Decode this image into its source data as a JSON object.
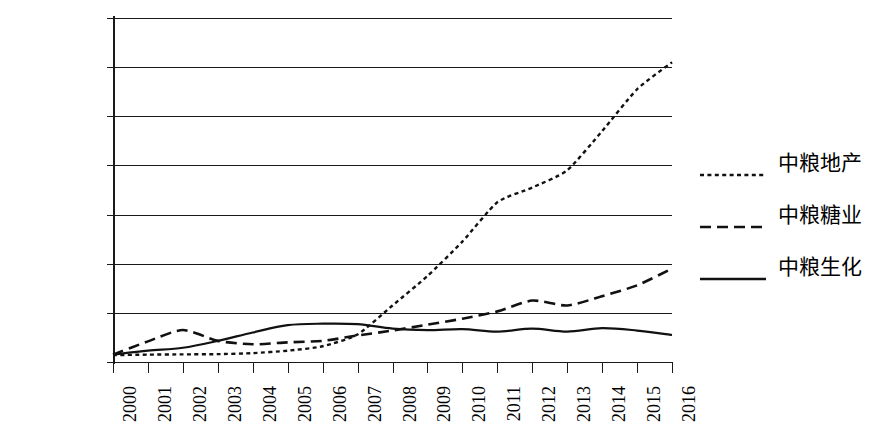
{
  "chart_data": {
    "type": "line",
    "title": "",
    "xlabel": "",
    "ylabel": "",
    "grid": true,
    "legend_position": "right",
    "categories": [
      "2000",
      "2001",
      "2002",
      "2003",
      "2004",
      "2005",
      "2006",
      "2007",
      "2008",
      "2009",
      "2010",
      "2011",
      "2012",
      "2013",
      "2014",
      "2015",
      "2016"
    ],
    "x": [
      2000,
      2001,
      2002,
      2003,
      2004,
      2005,
      2006,
      2007,
      2008,
      2009,
      2010,
      2011,
      2012,
      2013,
      2014,
      2015,
      2016
    ],
    "ylim": [
      0,
      7000000
    ],
    "xlim": [
      2000,
      2016
    ],
    "y_ticks": [
      0,
      1000000,
      2000000,
      3000000,
      4000000,
      5000000,
      6000000,
      7000000
    ],
    "y_tick_labels": [
      "0",
      "1000000",
      "2000000",
      "3000000",
      "4000000",
      "5000000",
      "6000000",
      "7000000"
    ],
    "series": [
      {
        "name": "中粮地产",
        "style": "dotted",
        "color": "#111111",
        "values": [
          140000,
          150000,
          155000,
          160000,
          180000,
          230000,
          320000,
          560000,
          1150000,
          1750000,
          2450000,
          3250000,
          3550000,
          3900000,
          4700000,
          5550000,
          6100000
        ]
      },
      {
        "name": "中粮糖业",
        "style": "dashed",
        "color": "#111111",
        "values": [
          150000,
          420000,
          650000,
          430000,
          360000,
          400000,
          430000,
          540000,
          640000,
          760000,
          880000,
          1030000,
          1250000,
          1150000,
          1340000,
          1560000,
          1900000
        ]
      },
      {
        "name": "中粮生化",
        "style": "solid",
        "color": "#111111",
        "values": [
          150000,
          230000,
          290000,
          430000,
          600000,
          750000,
          780000,
          770000,
          680000,
          650000,
          670000,
          620000,
          680000,
          620000,
          690000,
          640000,
          550000
        ]
      }
    ]
  },
  "legend": {
    "items": [
      {
        "label": "中粮地产",
        "style": "dotted"
      },
      {
        "label": "中粮糖业",
        "style": "dashed"
      },
      {
        "label": "中粮生化",
        "style": "solid"
      }
    ]
  }
}
